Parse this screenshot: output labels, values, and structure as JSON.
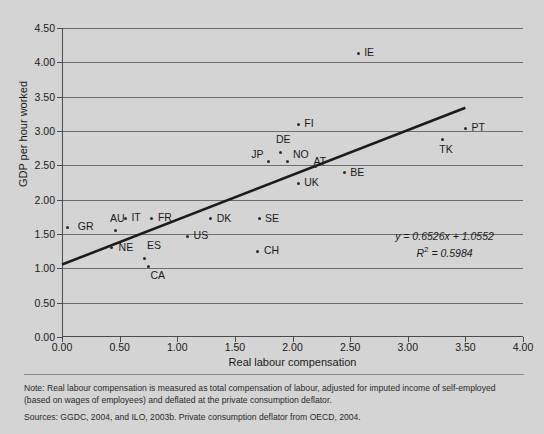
{
  "chart_data": {
    "type": "scatter",
    "title": "",
    "xlabel": "Real labour compensation",
    "ylabel": "GDP per hour worked",
    "xlim": [
      0.0,
      4.0
    ],
    "ylim": [
      0.0,
      4.5
    ],
    "xticks": [
      "0.00",
      "0.50",
      "1.00",
      "1.50",
      "2.00",
      "2.50",
      "3.00",
      "3.50",
      "4.00"
    ],
    "yticks": [
      "0.00",
      "0.50",
      "1.00",
      "1.50",
      "2.00",
      "2.50",
      "3.00",
      "3.50",
      "4.00",
      "4.50"
    ],
    "grid": "horizontal",
    "legend": "none",
    "points": [
      {
        "label": "GR",
        "x": 0.05,
        "y": 1.6,
        "lx": 10,
        "ly": -6
      },
      {
        "label": "IT",
        "x": 0.55,
        "y": 1.73,
        "lx": 6,
        "ly": -6
      },
      {
        "label": "AU",
        "x": 0.46,
        "y": 1.55,
        "lx": -5,
        "ly": -18
      },
      {
        "label": "NE",
        "x": 0.43,
        "y": 1.3,
        "lx": 7,
        "ly": -6
      },
      {
        "label": "FR",
        "x": 0.78,
        "y": 1.73,
        "lx": 6,
        "ly": -6
      },
      {
        "label": "ES",
        "x": 0.72,
        "y": 1.15,
        "lx": 2,
        "ly": -18
      },
      {
        "label": "CA",
        "x": 0.75,
        "y": 1.03,
        "lx": 2,
        "ly": 4
      },
      {
        "label": "US",
        "x": 1.09,
        "y": 1.47,
        "lx": 6,
        "ly": -6
      },
      {
        "label": "DK",
        "x": 1.29,
        "y": 1.72,
        "lx": 6,
        "ly": -6
      },
      {
        "label": "SE",
        "x": 1.71,
        "y": 1.72,
        "lx": 6,
        "ly": -6
      },
      {
        "label": "CH",
        "x": 1.7,
        "y": 1.25,
        "lx": 6,
        "ly": -6
      },
      {
        "label": "JP",
        "x": 1.79,
        "y": 2.55,
        "lx": -17,
        "ly": -13
      },
      {
        "label": "DE",
        "x": 1.9,
        "y": 2.69,
        "lx": -5,
        "ly": -18
      },
      {
        "label": "NO",
        "x": 1.96,
        "y": 2.55,
        "lx": 5,
        "ly": -13
      },
      {
        "label": "AT",
        "x": 2.2,
        "y": 2.49,
        "lx": -2,
        "ly": -10
      },
      {
        "label": "FI",
        "x": 2.05,
        "y": 3.1,
        "lx": 6,
        "ly": -6
      },
      {
        "label": "UK",
        "x": 2.05,
        "y": 2.24,
        "lx": 6,
        "ly": -6
      },
      {
        "label": "BE",
        "x": 2.45,
        "y": 2.39,
        "lx": 6,
        "ly": -6
      },
      {
        "label": "IE",
        "x": 2.57,
        "y": 4.13,
        "lx": 6,
        "ly": -6
      },
      {
        "label": "TK",
        "x": 3.3,
        "y": 2.87,
        "lx": -3,
        "ly": 4
      },
      {
        "label": "PT",
        "x": 3.5,
        "y": 3.04,
        "lx": 6,
        "ly": -6
      }
    ],
    "trendline": {
      "slope": 0.6526,
      "intercept": 1.0552,
      "x_start": 0.0,
      "x_end": 3.5
    },
    "annotations": {
      "equation": "y = 0.6526x + 1.0552",
      "r_squared_prefix": "R",
      "r_squared_exp": "2",
      "r_squared_value": "= 0.5984"
    }
  },
  "footnote": {
    "note": "Note: Real labour compensation is measured as total compensation of labour, adjusted for imputed income of self-employed (based on wages of employees) and deflated at the private consumption deflator.",
    "sources": "Sources: GGDC, 2004, and ILO, 2003b. Private consumption deflator from OECD, 2004."
  },
  "colors": {
    "background": "#d4d4d4",
    "axis": "#4a4a4a",
    "grid": "#6e6e6e",
    "marker": "#2b2b2b",
    "trend": "#1c1c1c",
    "text": "#1a1a1a"
  }
}
